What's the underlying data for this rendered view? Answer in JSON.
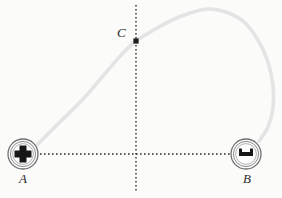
{
  "figure": {
    "background_color": "#fbfbfa",
    "width": 282,
    "height": 198
  },
  "labels": {
    "point_a": "A",
    "point_b": "B",
    "point_c": "C"
  },
  "axes": {
    "style": "dotted",
    "color": "#2b2b2b",
    "vertical": {
      "x": 136,
      "y_start": 5,
      "y_end": 191
    },
    "horizontal": {
      "y": 154,
      "x_start": 36,
      "x_end": 236
    }
  },
  "bodies": [
    {
      "name": "ball-a",
      "label": "A",
      "cx": 23,
      "cy": 154,
      "r": 15,
      "glyph": "cross-mark",
      "color": "#5d5d5d"
    },
    {
      "name": "ball-b",
      "label": "B",
      "cx": 246,
      "cy": 154,
      "r": 15,
      "glyph": "bar-mark",
      "color": "#5d5d5d"
    }
  ],
  "markers": [
    {
      "name": "point-c-marker",
      "label": "C",
      "x": 136,
      "y": 41,
      "shape": "square-dot",
      "color": "#1e1e1e"
    }
  ],
  "curve": {
    "name": "trajectory-path",
    "color": "#c8c8c8",
    "stroke_width": 2.1,
    "description": "Arc rising from A through C to an apex then descending to B",
    "points": [
      [
        36,
        146
      ],
      [
        60,
        122
      ],
      [
        85,
        97
      ],
      [
        108,
        70
      ],
      [
        124,
        52
      ],
      [
        136,
        41
      ],
      [
        152,
        31
      ],
      [
        170,
        21
      ],
      [
        190,
        13
      ],
      [
        208,
        9
      ],
      [
        226,
        12
      ],
      [
        244,
        22
      ],
      [
        258,
        40
      ],
      [
        268,
        62
      ],
      [
        273,
        86
      ],
      [
        273,
        108
      ],
      [
        268,
        127
      ],
      [
        259,
        141
      ]
    ]
  },
  "chart_data": {
    "type": "line",
    "xlabel": "",
    "ylabel": "",
    "xlim": [
      0,
      282
    ],
    "ylim": [
      0,
      198
    ],
    "grid": false,
    "legend": "none",
    "series": [
      {
        "name": "path",
        "x": [
          36,
          60,
          85,
          108,
          124,
          136,
          152,
          170,
          190,
          208,
          226,
          244,
          258,
          268,
          273,
          273,
          268,
          259
        ],
        "y": [
          146,
          122,
          97,
          70,
          52,
          41,
          31,
          21,
          13,
          9,
          12,
          22,
          40,
          62,
          86,
          108,
          127,
          141
        ]
      }
    ],
    "annotations": [
      {
        "label": "A",
        "x": 23,
        "y": 154
      },
      {
        "label": "C",
        "x": 136,
        "y": 41
      },
      {
        "label": "B",
        "x": 246,
        "y": 154
      }
    ]
  }
}
